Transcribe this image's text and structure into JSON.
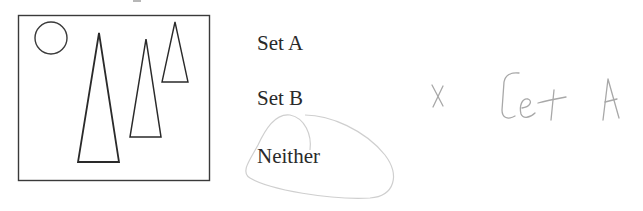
{
  "question": {
    "figure": {
      "description": "Rectangle containing a small circle at top-left and three tall narrow isosceles triangles of decreasing size",
      "shapes": [
        "circle",
        "triangle",
        "triangle",
        "triangle"
      ]
    },
    "options": [
      {
        "id": "set-a",
        "label": "Set A"
      },
      {
        "id": "set-b",
        "label": "Set B"
      },
      {
        "id": "neither",
        "label": "Neither"
      }
    ],
    "circled_option": "Neither"
  },
  "annotation": {
    "mark": "x",
    "handwritten_text": "Set A",
    "color": "#a8a8a8"
  },
  "colors": {
    "ink": "#2a2a2a",
    "pencil": "#a8a8a8",
    "loop": "#cfcfcf"
  }
}
